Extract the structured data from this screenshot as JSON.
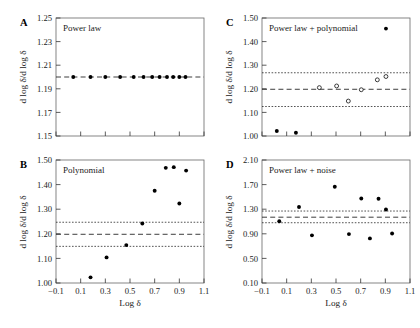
{
  "figure": {
    "panels": [
      "A",
      "B",
      "C",
      "D"
    ],
    "shared_xlabel": "Log δ",
    "shared_ylabel": "d log δ/d log δ"
  },
  "chart_data": [
    {
      "type": "scatter",
      "panel": "A",
      "title": "Power law",
      "xlabel": "Log δ",
      "ylabel": "d log δ/d log δ",
      "xlim": [
        -0.1,
        1.1
      ],
      "ylim": [
        1.15,
        1.25
      ],
      "xticks": [
        -0.1,
        0.1,
        0.3,
        0.5,
        0.7,
        0.9,
        1.1
      ],
      "xticklabels": [
        "−0.1",
        "0.1",
        "0.3",
        "0.5",
        "0.7",
        "0.9",
        "1.1"
      ],
      "yticks": [
        1.15,
        1.17,
        1.19,
        1.21,
        1.23,
        1.25
      ],
      "yticklabels": [
        "1.15",
        "1.17",
        "1.19",
        "1.21",
        "1.23",
        "1.25"
      ],
      "grid": false,
      "legend": "none",
      "reference_lines": [
        {
          "name": "mean",
          "style": "dashed",
          "y": 1.2
        }
      ],
      "series": [
        {
          "name": "local slope",
          "marker": "filled-circle",
          "x": [
            0.04,
            0.18,
            0.3,
            0.42,
            0.53,
            0.61,
            0.68,
            0.74,
            0.8,
            0.85,
            0.9,
            0.95
          ],
          "y": [
            1.2,
            1.2,
            1.2,
            1.2,
            1.2,
            1.2,
            1.2,
            1.2,
            1.2,
            1.2,
            1.2,
            1.2
          ]
        }
      ]
    },
    {
      "type": "scatter",
      "panel": "B",
      "title": "Polynomial",
      "xlabel": "Log δ",
      "ylabel": "d log δ/d log δ",
      "xlim": [
        -0.1,
        1.1
      ],
      "ylim": [
        1.0,
        1.5
      ],
      "xticks": [
        -0.1,
        0.1,
        0.3,
        0.5,
        0.7,
        0.9,
        1.1
      ],
      "xticklabels": [
        "−0.1",
        "0.1",
        "0.3",
        "0.5",
        "0.7",
        "0.9",
        "1.1"
      ],
      "yticks": [
        1.0,
        1.1,
        1.2,
        1.3,
        1.4,
        1.5
      ],
      "yticklabels": [
        "1.00",
        "1.10",
        "1.20",
        "1.30",
        "1.40",
        "1.50"
      ],
      "grid": false,
      "legend": "none",
      "reference_lines": [
        {
          "name": "mean",
          "style": "dashed",
          "y": 1.198
        },
        {
          "name": "upper-band",
          "style": "dotted",
          "y": 1.247
        },
        {
          "name": "lower-band",
          "style": "dotted",
          "y": 1.149
        }
      ],
      "series": [
        {
          "name": "local slope",
          "marker": "filled-circle",
          "x": [
            0.18,
            0.31,
            0.47,
            0.6,
            0.7,
            0.79,
            0.855,
            0.9,
            0.955
          ],
          "y": [
            1.023,
            1.104,
            1.154,
            1.242,
            1.375,
            1.468,
            1.471,
            1.323,
            1.457
          ]
        }
      ]
    },
    {
      "type": "scatter",
      "panel": "C",
      "title": "Power law + polynomial",
      "xlabel": "Log δ",
      "ylabel": "d log δ/d log δ",
      "xlim": [
        -0.1,
        1.1
      ],
      "ylim": [
        1.0,
        1.5
      ],
      "xticks": [
        -0.1,
        0.1,
        0.3,
        0.5,
        0.7,
        0.9,
        1.1
      ],
      "xticklabels": [
        "−0.1",
        "0.1",
        "0.3",
        "0.5",
        "0.7",
        "0.9",
        "1.1"
      ],
      "yticks": [
        1.0,
        1.1,
        1.2,
        1.3,
        1.4,
        1.5
      ],
      "yticklabels": [
        "1.00",
        "1.10",
        "1.20",
        "1.30",
        "1.40",
        "1.50"
      ],
      "grid": false,
      "legend": "none",
      "reference_lines": [
        {
          "name": "mean",
          "style": "dashed",
          "y": 1.198
        },
        {
          "name": "upper-band",
          "style": "dotted",
          "y": 1.268
        },
        {
          "name": "lower-band",
          "style": "dotted",
          "y": 1.125
        }
      ],
      "series": [
        {
          "name": "local slope open",
          "marker": "open-circle",
          "x": [
            0.365,
            0.505,
            0.6,
            0.705,
            0.835,
            0.905
          ],
          "y": [
            1.205,
            1.212,
            1.148,
            1.196,
            1.238,
            1.252
          ]
        },
        {
          "name": "local slope filled",
          "marker": "filled-circle",
          "x": [
            0.02,
            0.175,
            0.905
          ],
          "y": [
            1.021,
            1.014,
            1.455
          ]
        }
      ]
    },
    {
      "type": "scatter",
      "panel": "D",
      "title": "Power law + noise",
      "xlabel": "Log δ",
      "ylabel": "d log δ/d log δ",
      "xlim": [
        -0.1,
        1.1
      ],
      "ylim": [
        0.1,
        2.1
      ],
      "xticks": [
        -0.1,
        0.1,
        0.3,
        0.5,
        0.7,
        0.9,
        1.1
      ],
      "xticklabels": [
        "−0.1",
        "0.1",
        "0.3",
        "0.5",
        "0.7",
        "0.9",
        "1.1"
      ],
      "yticks": [
        0.1,
        0.5,
        0.9,
        1.3,
        1.7,
        2.1
      ],
      "yticklabels": [
        "0.10",
        "0.50",
        "0.90",
        "1.30",
        "1.70",
        "2.10"
      ],
      "grid": false,
      "legend": "none",
      "reference_lines": [
        {
          "name": "mean",
          "style": "dashed",
          "y": 1.17
        },
        {
          "name": "upper-band",
          "style": "dotted",
          "y": 1.27
        },
        {
          "name": "lower-band",
          "style": "dotted",
          "y": 1.08
        }
      ],
      "series": [
        {
          "name": "local slope",
          "marker": "filled-circle",
          "x": [
            0.04,
            0.2,
            0.305,
            0.49,
            0.605,
            0.705,
            0.775,
            0.845,
            0.905,
            0.955
          ],
          "y": [
            1.105,
            1.335,
            0.875,
            1.665,
            0.895,
            1.475,
            0.825,
            1.47,
            1.295,
            0.905
          ]
        }
      ]
    }
  ]
}
